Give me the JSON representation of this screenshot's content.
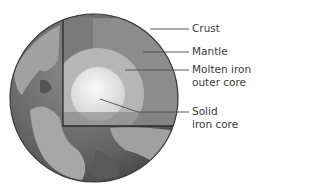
{
  "diagram": {
    "colors": {
      "ocean": "#6e6e6e",
      "land": "#a9a9a9",
      "mantle": "#8c8c8c",
      "outer_core": "#b6b6b6",
      "inner_core": "#e4e4e4",
      "outline": "#2a2a2a",
      "leader_line": "#4a4a4a"
    },
    "labels": [
      {
        "id": "crust",
        "lines": [
          "Crust"
        ]
      },
      {
        "id": "mantle",
        "lines": [
          "Mantle"
        ]
      },
      {
        "id": "outer-core",
        "lines": [
          "Molten iron",
          "outer core"
        ]
      },
      {
        "id": "inner-core",
        "lines": [
          "Solid",
          "iron core"
        ]
      }
    ]
  }
}
